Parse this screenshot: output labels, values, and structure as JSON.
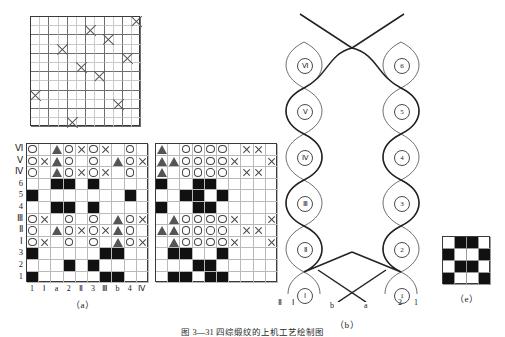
{
  "figure": {
    "caption": "图 3—31  四综缎纹的上机工艺绘制图",
    "subfigures": [
      {
        "id": "a",
        "label": "（a）"
      },
      {
        "id": "b",
        "label": "（b）"
      },
      {
        "id": "e",
        "label": "（e）"
      }
    ]
  },
  "top_grid": {
    "name": "draft-grid",
    "cols": 12,
    "rows": 12,
    "marks": [
      {
        "r": 0,
        "c": 11
      },
      {
        "r": 1,
        "c": 6
      },
      {
        "r": 2,
        "c": 8
      },
      {
        "r": 3,
        "c": 3
      },
      {
        "r": 4,
        "c": 10
      },
      {
        "r": 5,
        "c": 5
      },
      {
        "r": 6,
        "c": 7
      },
      {
        "r": 8,
        "c": 0
      },
      {
        "r": 9,
        "c": 9
      },
      {
        "r": 11,
        "c": 4
      }
    ]
  },
  "grid_a": {
    "name": "weave-plan-a",
    "row_labels": [
      "Ⅵ",
      "Ⅴ",
      "Ⅳ",
      "6",
      "5",
      "4",
      "Ⅲ",
      "Ⅱ",
      "Ⅰ",
      "3",
      "2",
      "1"
    ],
    "col_labels": [
      "1",
      "Ⅰ",
      "a",
      "2",
      "Ⅱ",
      "3",
      "Ⅲ",
      "b",
      "4",
      "Ⅳ"
    ],
    "cells": [
      [
        "o",
        "",
        "tri",
        "o",
        "x",
        "o",
        "x",
        "",
        "o",
        ""
      ],
      [
        "o",
        "x",
        "tri",
        "o",
        "",
        "o",
        "",
        "tri",
        "o",
        "x"
      ],
      [
        "o",
        "",
        "tri",
        "o",
        "x",
        "o",
        "x",
        "",
        "o",
        ""
      ],
      [
        "",
        "",
        "f",
        "f",
        "",
        "f",
        "",
        "",
        "",
        ""
      ],
      [
        "f",
        "",
        "",
        "",
        "",
        "",
        "",
        "",
        "f",
        ""
      ],
      [
        "",
        "",
        "f",
        "f",
        "",
        "f",
        "",
        "",
        "",
        ""
      ],
      [
        "o",
        "x",
        "",
        "o",
        "",
        "o",
        "",
        "tri",
        "o",
        "x"
      ],
      [
        "o",
        "",
        "tri",
        "o",
        "x",
        "o",
        "x",
        "tri",
        "o",
        ""
      ],
      [
        "o",
        "x",
        "",
        "o",
        "",
        "o",
        "",
        "tri",
        "o",
        "x"
      ],
      [
        "f",
        "",
        "",
        "",
        "",
        "",
        "f",
        "f",
        "",
        ""
      ],
      [
        "",
        "",
        "",
        "f",
        "",
        "f",
        "",
        "",
        "",
        ""
      ],
      [
        "f",
        "",
        "",
        "",
        "",
        "",
        "f",
        "f",
        "",
        ""
      ]
    ]
  },
  "grid_b": {
    "name": "weave-plan-b",
    "cells": [
      [
        "tri",
        "",
        "o",
        "o",
        "o",
        "o",
        "",
        "x",
        "x",
        ""
      ],
      [
        "tri",
        "tri",
        "o",
        "o",
        "o",
        "o",
        "x",
        "",
        "",
        "x"
      ],
      [
        "tri",
        "",
        "o",
        "o",
        "o",
        "o",
        "",
        "x",
        "x",
        ""
      ],
      [
        "f",
        "",
        "",
        "f",
        "f",
        "",
        "",
        "",
        "",
        ""
      ],
      [
        "",
        "",
        "f",
        "f",
        "",
        "f",
        "",
        "",
        "",
        ""
      ],
      [
        "f",
        "",
        "",
        "f",
        "f",
        "",
        "",
        "",
        "",
        ""
      ],
      [
        "",
        "tri",
        "o",
        "o",
        "o",
        "o",
        "x",
        "",
        "",
        "x"
      ],
      [
        "tri",
        "tri",
        "o",
        "o",
        "o",
        "o",
        "",
        "x",
        "x",
        ""
      ],
      [
        "",
        "tri",
        "o",
        "o",
        "o",
        "o",
        "x",
        "",
        "",
        "x"
      ],
      [
        "",
        "f",
        "f",
        "",
        "",
        "f",
        "",
        "",
        "",
        ""
      ],
      [
        "",
        "",
        "",
        "f",
        "f",
        "",
        "",
        "",
        "",
        ""
      ],
      [
        "",
        "f",
        "f",
        "",
        "f",
        "f",
        "",
        "",
        "",
        ""
      ]
    ]
  },
  "braid": {
    "name": "threading-diagram",
    "left_circles": [
      "Ⅵ",
      "Ⅴ",
      "Ⅳ",
      "Ⅲ",
      "Ⅱ",
      "Ⅰ"
    ],
    "right_circles": [
      "6",
      "5",
      "4",
      "3",
      "2",
      "1"
    ],
    "bottom_labels_left": [
      "Ⅱ",
      "Ⅰ"
    ],
    "bottom_labels_center": [
      "b",
      "a"
    ],
    "bottom_labels_right": [
      "2",
      "1"
    ]
  },
  "grid_e": {
    "name": "weave-repeat-e",
    "size": 4,
    "cells": [
      [
        "",
        "f",
        "f",
        ""
      ],
      [
        "f",
        "",
        "",
        "f"
      ],
      [
        "",
        "f",
        "f",
        ""
      ],
      [
        "f",
        "",
        "",
        "f"
      ]
    ]
  },
  "colors": {
    "ink": "#1a1a1a",
    "grid_light": "#b9b9b9",
    "grid_heavy": "#3a3a3a",
    "fill": "#111111"
  }
}
